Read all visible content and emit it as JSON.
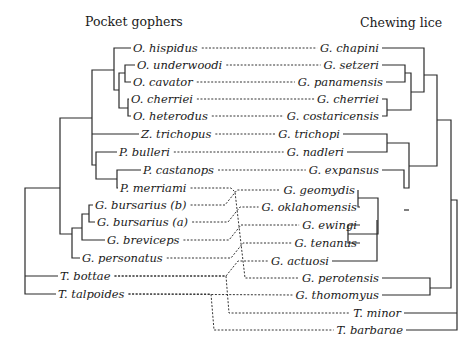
{
  "headers": {
    "left": "Pocket gophers",
    "right": "Chewing lice"
  },
  "gophers": [
    "O. hispidus",
    "O. underwoodi",
    "O. cavator",
    "O. cherriei",
    "O. heterodus",
    "Z. trichopus",
    "P. bulleri",
    "P. castanops",
    "P. merriami",
    "G. bursarius (b)",
    "G. bursarius (a)",
    "G. breviceps",
    "G. personatus",
    "T. bottae",
    "T. talpoides"
  ],
  "lice": [
    "G. chapini",
    "G. setzeri",
    "G. panamensis",
    "G. cherriei",
    "G. costaricensis",
    "G. trichopi",
    "G. nadleri",
    "G. expansus",
    "G. geomydis",
    "G. oklahomensis",
    "G. ewingi",
    "G. tenanus",
    "G. actuosi",
    "G. perotensis",
    "G. thomomyus",
    "T. minor",
    "T. barbarae"
  ],
  "associations": [
    [
      "O. hispidus",
      "G. chapini"
    ],
    [
      "O. underwoodi",
      "G. setzeri"
    ],
    [
      "O. cavator",
      "G. panamensis"
    ],
    [
      "O. cherriei",
      "G. cherriei"
    ],
    [
      "O. heterodus",
      "G. costaricensis"
    ],
    [
      "Z. trichopus",
      "G. trichopi"
    ],
    [
      "P. bulleri",
      "G. nadleri"
    ],
    [
      "P. castanops",
      "G. expansus"
    ],
    [
      "P. merriami",
      "G. perotensis"
    ],
    [
      "G. bursarius (b)",
      "G. geomydis"
    ],
    [
      "G. bursarius (a)",
      "G. oklahomensis"
    ],
    [
      "G. breviceps",
      "G. ewingi"
    ],
    [
      "G. personatus",
      "G. tenanus"
    ],
    [
      "T. bottae",
      "G. actuosi"
    ],
    [
      "T. bottae",
      "T. minor"
    ],
    [
      "T. talpoides",
      "G. thomomyus"
    ],
    [
      "T. talpoides",
      "T. barbarae"
    ]
  ],
  "gopher_tree": "((((O. hispidus,((O. underwoodi,O. cavator),(O. cherriei,O. heterodus))),Z. trichopus,(P. bulleri,(P. castanops,P. merriami))),(((G. bursarius (b),G. bursarius (a)),G. breviceps),G. personatus)),T. bottae,T. talpoides)",
  "louse_tree": "((((G. chapini,((G. setzeri,G. panamensis),(G. cherriei,G. costaricensis))),(((G. trichopi,G. nadleri),G. expansus),((G. geomydis,G. oklahomensis),((G. ewingi,G. tenanus),G. actuosi)))),(G. perotensis,G. thomomyus)),T. minor,T. barbarae)"
}
